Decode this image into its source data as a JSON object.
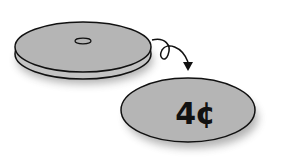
{
  "illustration": {
    "description": "Token flipped over revealing its price",
    "token_back": {
      "has_center_hole": true
    },
    "token_front": {
      "label": "4¢"
    },
    "arrow": "curved-loop-arrow",
    "colors": {
      "token_fill": "#b5b5b5",
      "outline": "#111111",
      "background": "#ffffff"
    }
  }
}
